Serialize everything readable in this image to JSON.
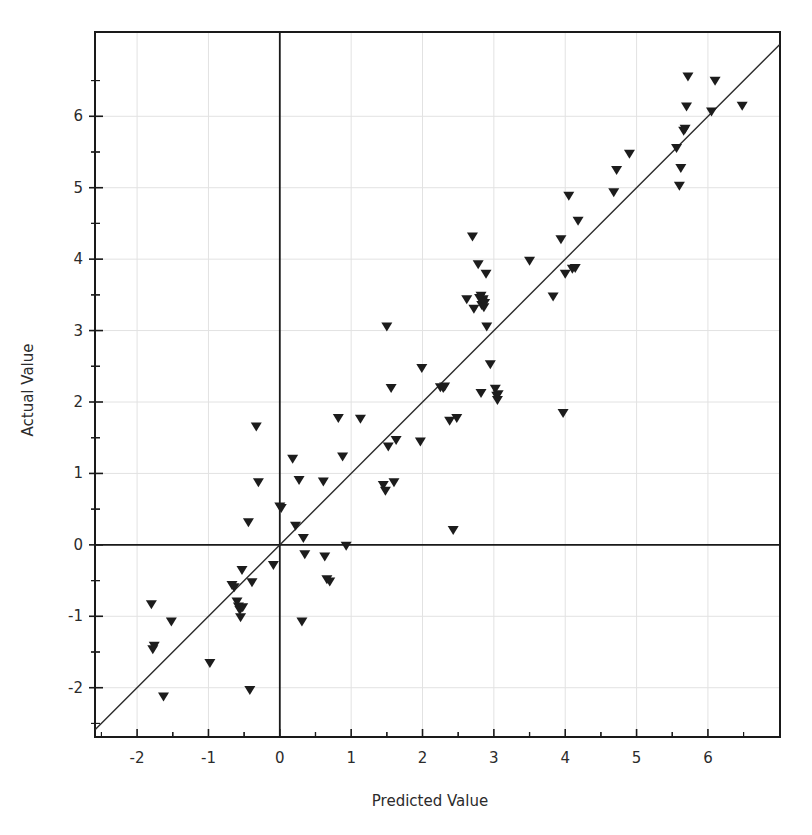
{
  "chart_data": {
    "type": "scatter",
    "title": "",
    "xlabel": "Predicted Value",
    "ylabel": "Actual Value",
    "xlim": [
      -2.59,
      7.01
    ],
    "ylim": [
      -2.69,
      7.18
    ],
    "xticks": [
      -2,
      -1,
      0,
      1,
      2,
      3,
      4,
      5,
      6
    ],
    "yticks": [
      -2,
      -1,
      0,
      1,
      2,
      3,
      4,
      5,
      6
    ],
    "xtick_labels": [
      "-2",
      "-1",
      "0",
      "1",
      "2",
      "3",
      "4",
      "5",
      "6"
    ],
    "ytick_labels": [
      "-2",
      "-1",
      "0",
      "1",
      "2",
      "3",
      "4",
      "5",
      "6"
    ],
    "minor_ticks": true,
    "grid": true,
    "grid_color": "#e2e2e2",
    "zero_lines": {
      "x": 0,
      "y": 0,
      "color": "#1a1a1a"
    },
    "marker": {
      "shape": "triangle-down",
      "color": "#1c1c1c",
      "size": 11
    },
    "reference_line": {
      "label": "y = x identity line",
      "slope": 1,
      "intercept": 0,
      "color": "#2a2a2a"
    },
    "series": [
      {
        "name": "Actual vs Predicted",
        "points": [
          [
            -1.8,
            -0.84
          ],
          [
            -1.76,
            -1.42
          ],
          [
            -1.78,
            -1.47
          ],
          [
            -1.63,
            -2.13
          ],
          [
            -1.52,
            -1.08
          ],
          [
            -0.98,
            -1.66
          ],
          [
            -0.67,
            -0.57
          ],
          [
            -0.64,
            -0.6
          ],
          [
            -0.6,
            -0.8
          ],
          [
            -0.58,
            -0.87
          ],
          [
            -0.56,
            -0.92
          ],
          [
            -0.55,
            -1.02
          ],
          [
            -0.53,
            -0.36
          ],
          [
            -0.52,
            -0.88
          ],
          [
            -0.44,
            0.31
          ],
          [
            -0.42,
            -2.04
          ],
          [
            -0.39,
            -0.53
          ],
          [
            -0.33,
            1.65
          ],
          [
            -0.3,
            0.87
          ],
          [
            -0.09,
            -0.29
          ],
          [
            0.0,
            0.53
          ],
          [
            0.02,
            0.51
          ],
          [
            0.18,
            1.2
          ],
          [
            0.22,
            0.26
          ],
          [
            0.27,
            0.9
          ],
          [
            0.31,
            -1.08
          ],
          [
            0.33,
            0.09
          ],
          [
            0.35,
            -0.14
          ],
          [
            0.61,
            0.88
          ],
          [
            0.63,
            -0.17
          ],
          [
            0.66,
            -0.49
          ],
          [
            0.7,
            -0.52
          ],
          [
            0.88,
            1.23
          ],
          [
            0.93,
            -0.02
          ],
          [
            1.13,
            1.76
          ],
          [
            0.82,
            1.77
          ],
          [
            1.45,
            0.83
          ],
          [
            1.48,
            0.75
          ],
          [
            1.5,
            3.05
          ],
          [
            1.52,
            1.37
          ],
          [
            1.6,
            0.87
          ],
          [
            1.63,
            1.46
          ],
          [
            1.97,
            1.44
          ],
          [
            1.99,
            2.47
          ],
          [
            1.56,
            2.19
          ],
          [
            2.25,
            2.2
          ],
          [
            2.29,
            2.19
          ],
          [
            2.31,
            2.21
          ],
          [
            2.38,
            1.73
          ],
          [
            2.43,
            0.2
          ],
          [
            2.48,
            1.77
          ],
          [
            2.62,
            3.43
          ],
          [
            2.7,
            4.31
          ],
          [
            2.78,
            3.92
          ],
          [
            2.8,
            3.45
          ],
          [
            2.82,
            3.48
          ],
          [
            2.83,
            3.35
          ],
          [
            2.84,
            3.4
          ],
          [
            2.85,
            3.43
          ],
          [
            2.86,
            3.32
          ],
          [
            2.87,
            3.38
          ],
          [
            2.72,
            3.3
          ],
          [
            2.89,
            3.79
          ],
          [
            2.9,
            3.05
          ],
          [
            2.82,
            2.12
          ],
          [
            2.95,
            2.52
          ],
          [
            3.02,
            2.18
          ],
          [
            3.04,
            2.08
          ],
          [
            3.05,
            2.02
          ],
          [
            3.06,
            2.1
          ],
          [
            3.5,
            3.97
          ],
          [
            3.83,
            3.47
          ],
          [
            3.97,
            1.84
          ],
          [
            3.94,
            4.27
          ],
          [
            4.0,
            3.79
          ],
          [
            4.1,
            3.86
          ],
          [
            4.14,
            3.87
          ],
          [
            4.18,
            4.53
          ],
          [
            4.05,
            4.88
          ],
          [
            4.68,
            4.93
          ],
          [
            4.72,
            5.24
          ],
          [
            4.9,
            5.47
          ],
          [
            5.56,
            5.55
          ],
          [
            5.6,
            5.02
          ],
          [
            5.62,
            5.27
          ],
          [
            5.66,
            5.79
          ],
          [
            5.68,
            5.82
          ],
          [
            5.7,
            6.13
          ],
          [
            5.72,
            6.55
          ],
          [
            6.05,
            6.06
          ],
          [
            6.1,
            6.49
          ],
          [
            6.48,
            6.14
          ]
        ]
      }
    ]
  }
}
